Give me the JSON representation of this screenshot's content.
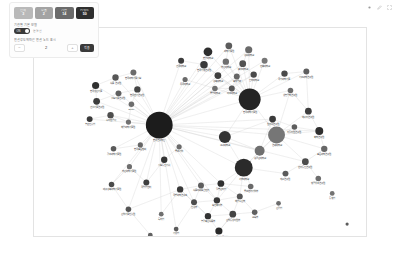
{
  "panel": {
    "stats": [
      {
        "label": "전체",
        "value": "3",
        "color": "#b9b9b9"
      },
      {
        "label": "추출",
        "value": "2",
        "color": "#a3a3a3"
      },
      {
        "label": "기관",
        "value": "14",
        "color": "#6b6b6b"
      },
      {
        "label": "키워드",
        "value": "50",
        "color": "#2f2f2f"
      }
    ],
    "filter_label": "기관별 기본 모델",
    "toggle_text": "ON",
    "toggle_side_label": "연결선",
    "depth_label": "연결강도에따른 연결 노드 표시",
    "stepper": {
      "minus": "−",
      "value": "2",
      "plus": "+"
    },
    "apply_label": "적용"
  },
  "toolbar": {
    "icons": [
      "dot-icon",
      "edit-icon",
      "expand-icon"
    ]
  },
  "graph": {
    "nodes": [
      {
        "id": "hub",
        "label": "한국연구재단",
        "x": 126,
        "y": 98,
        "r": 13.5,
        "c": "#1c1c1c",
        "fs": 2.8
      },
      {
        "id": "h2",
        "label": "한국과학기술원",
        "x": 217,
        "y": 72,
        "r": 11.0,
        "c": "#242424",
        "fs": 2.6
      },
      {
        "id": "h3",
        "label": "서울대학교",
        "x": 211,
        "y": 141,
        "r": 9.0,
        "c": "#2b2b2b",
        "fs": 2.6
      },
      {
        "id": "h4",
        "label": "연세대학교",
        "x": 244,
        "y": 108,
        "r": 8.5,
        "c": "#767676",
        "fs": 2.6
      },
      {
        "id": "h5",
        "label": "고려대학교",
        "x": 192,
        "y": 110,
        "r": 6.0,
        "c": "#333333",
        "fs": 2.4
      },
      {
        "id": "h6",
        "label": "성균관대학교",
        "x": 227,
        "y": 124,
        "r": 5.0,
        "c": "#6f6f6f",
        "fs": 2.3
      },
      {
        "id": "t1",
        "label": "한양대학교",
        "x": 175,
        "y": 24,
        "r": 4.4,
        "c": "#2e2e2e",
        "fs": 2.3
      },
      {
        "id": "t2",
        "label": "과학기술원",
        "x": 196,
        "y": 18,
        "r": 3.4,
        "c": "#5c5c5c",
        "fs": 2.2
      },
      {
        "id": "t3",
        "label": "경희대학교",
        "x": 216,
        "y": 22,
        "r": 3.6,
        "c": "#6a6a6a",
        "fs": 2.2
      },
      {
        "id": "t4",
        "label": "한국기계연구원",
        "x": 171,
        "y": 37,
        "r": 3.8,
        "c": "#3a3a3a",
        "fs": 2.2
      },
      {
        "id": "t5",
        "label": "부산대학교",
        "x": 193,
        "y": 34,
        "r": 3.2,
        "c": "#6f6f6f",
        "fs": 2.2
      },
      {
        "id": "t6",
        "label": "충남대학교",
        "x": 210,
        "y": 36,
        "r": 3.4,
        "c": "#525252",
        "fs": 2.2
      },
      {
        "id": "t7",
        "label": "전북대학교",
        "x": 232,
        "y": 33,
        "r": 3.0,
        "c": "#777777",
        "fs": 2.2
      },
      {
        "id": "t8",
        "label": "경북대학교",
        "x": 185,
        "y": 48,
        "r": 3.4,
        "c": "#3f3f3f",
        "fs": 2.2
      },
      {
        "id": "t9",
        "label": "포항공과",
        "x": 204,
        "y": 49,
        "r": 3.0,
        "c": "#666666",
        "fs": 2.2
      },
      {
        "id": "t10",
        "label": "인하대학교",
        "x": 221,
        "y": 47,
        "r": 3.2,
        "c": "#4a4a4a",
        "fs": 2.2
      },
      {
        "id": "t11",
        "label": "아주대학교",
        "x": 199,
        "y": 61,
        "r": 3.0,
        "c": "#585858",
        "fs": 2.2
      },
      {
        "id": "t12",
        "label": "중앙대학교",
        "x": 182,
        "y": 61,
        "r": 2.8,
        "c": "#707070",
        "fs": 2.2
      },
      {
        "id": "t13",
        "label": "건국대학교",
        "x": 148,
        "y": 33,
        "r": 3.0,
        "c": "#3c3c3c",
        "fs": 2.2
      },
      {
        "id": "t14",
        "label": "동국대학교",
        "x": 152,
        "y": 52,
        "r": 2.6,
        "c": "#6a6a6a",
        "fs": 2.2
      },
      {
        "id": "r1",
        "label": "국가과학기술",
        "x": 252,
        "y": 46,
        "r": 3.2,
        "c": "#4a4a4a",
        "fs": 2.2
      },
      {
        "id": "r2",
        "label": "기초과학연구원",
        "x": 274,
        "y": 44,
        "r": 3.0,
        "c": "#5e5e5e",
        "fs": 2.2
      },
      {
        "id": "r3",
        "label": "생명공학연구원",
        "x": 258,
        "y": 63,
        "r": 2.8,
        "c": "#6b6b6b",
        "fs": 2.2
      },
      {
        "id": "r4",
        "label": "에너지연구원",
        "x": 276,
        "y": 84,
        "r": 3.4,
        "c": "#3e3e3e",
        "fs": 2.2
      },
      {
        "id": "r5",
        "label": "화학연구원",
        "x": 287,
        "y": 104,
        "r": 4.0,
        "c": "#2f2f2f",
        "fs": 2.2
      },
      {
        "id": "r6",
        "label": "표준과학연구원",
        "x": 292,
        "y": 122,
        "r": 3.2,
        "c": "#676767",
        "fs": 2.2
      },
      {
        "id": "r7",
        "label": "전자통신연구원",
        "x": 273,
        "y": 135,
        "r": 3.4,
        "c": "#4c4c4c",
        "fs": 2.2
      },
      {
        "id": "r8",
        "label": "재료연구원",
        "x": 253,
        "y": 147,
        "r": 3.0,
        "c": "#5a5a5a",
        "fs": 2.2
      },
      {
        "id": "r9",
        "label": "항공우주연구원",
        "x": 286,
        "y": 152,
        "r": 2.8,
        "c": "#6e6e6e",
        "fs": 2.2
      },
      {
        "id": "r10",
        "label": "원자력연구원",
        "x": 240,
        "y": 92,
        "r": 3.4,
        "c": "#3b3b3b",
        "fs": 2.2
      },
      {
        "id": "r11",
        "label": "지질자원연구원",
        "x": 262,
        "y": 100,
        "r": 2.8,
        "c": "#5d5d5d",
        "fs": 2.2
      },
      {
        "id": "l1",
        "label": "한국생산기술",
        "x": 62,
        "y": 58,
        "r": 3.6,
        "c": "#303030",
        "fs": 2.2
      },
      {
        "id": "l2",
        "label": "식품연구원",
        "x": 82,
        "y": 50,
        "r": 3.2,
        "c": "#575757",
        "fs": 2.2
      },
      {
        "id": "l3",
        "label": "한국과학기술정보",
        "x": 100,
        "y": 45,
        "r": 3.0,
        "c": "#6b6b6b",
        "fs": 2.2
      },
      {
        "id": "l4",
        "label": "건설기술연구원",
        "x": 63,
        "y": 74,
        "r": 3.4,
        "c": "#3d3d3d",
        "fs": 2.2
      },
      {
        "id": "l5",
        "label": "철도기술연구원",
        "x": 85,
        "y": 66,
        "r": 3.0,
        "c": "#5f5f5f",
        "fs": 2.2
      },
      {
        "id": "l6",
        "label": "한국전기연구원",
        "x": 104,
        "y": 62,
        "r": 3.2,
        "c": "#454545",
        "fs": 2.2
      },
      {
        "id": "l7",
        "label": "ETRI",
        "x": 98,
        "y": 77,
        "r": 2.8,
        "c": "#6d6d6d",
        "fs": 2.3
      },
      {
        "id": "l8",
        "label": "수자원공사",
        "x": 77,
        "y": 88,
        "r": 3.2,
        "c": "#4e4e4e",
        "fs": 2.2
      },
      {
        "id": "l9",
        "label": "농촌진흥청",
        "x": 56,
        "y": 92,
        "r": 3.0,
        "c": "#3a3a3a",
        "fs": 2.2
      },
      {
        "id": "l10",
        "label": "해양과학기술원",
        "x": 95,
        "y": 95,
        "r": 2.6,
        "c": "#717171",
        "fs": 2.2
      },
      {
        "id": "m1",
        "label": "광주과학기술원",
        "x": 80,
        "y": 122,
        "r": 2.8,
        "c": "#5a5a5a",
        "fs": 2.2
      },
      {
        "id": "m2",
        "label": "울산과학기술원",
        "x": 96,
        "y": 140,
        "r": 2.6,
        "c": "#6e6e6e",
        "fs": 2.2
      },
      {
        "id": "m3",
        "label": "대구경북과학기술원",
        "x": 78,
        "y": 158,
        "r": 2.8,
        "c": "#4b4b4b",
        "fs": 2.2
      },
      {
        "id": "m4",
        "label": "한국표준협회",
        "x": 107,
        "y": 118,
        "r": 2.6,
        "c": "#666666",
        "fs": 2.2
      },
      {
        "id": "m5",
        "label": "국립암센터",
        "x": 113,
        "y": 156,
        "r": 3.0,
        "c": "#3f3f3f",
        "fs": 2.2
      },
      {
        "id": "m6",
        "label": "산업기술진흥원",
        "x": 95,
        "y": 183,
        "r": 2.8,
        "c": "#555555",
        "fs": 2.2
      },
      {
        "id": "m7",
        "label": "정보통신기획",
        "x": 131,
        "y": 133,
        "r": 3.2,
        "c": "#343434",
        "fs": 2.2
      },
      {
        "id": "m8",
        "label": "중소기업",
        "x": 146,
        "y": 120,
        "r": 2.6,
        "c": "#6b6b6b",
        "fs": 2.2
      },
      {
        "id": "b1",
        "label": "국방과학연구소",
        "x": 147,
        "y": 163,
        "r": 3.2,
        "c": "#3a3a3a",
        "fs": 2.2
      },
      {
        "id": "b2",
        "label": "식품의약품안전처",
        "x": 168,
        "y": 159,
        "r": 3.0,
        "c": "#5e5e5e",
        "fs": 2.2
      },
      {
        "id": "b3",
        "label": "질병관리청",
        "x": 188,
        "y": 157,
        "r": 3.4,
        "c": "#2f2f2f",
        "fs": 2.2
      },
      {
        "id": "b4",
        "label": "환경부",
        "x": 161,
        "y": 176,
        "r": 3.0,
        "c": "#4d4d4d",
        "fs": 2.2
      },
      {
        "id": "b5",
        "label": "보건복지부",
        "x": 184,
        "y": 174,
        "r": 3.2,
        "c": "#383838",
        "fs": 2.2
      },
      {
        "id": "b6",
        "label": "해양수산부",
        "x": 207,
        "y": 170,
        "r": 3.0,
        "c": "#565656",
        "fs": 2.2
      },
      {
        "id": "b7",
        "label": "농림축산식품부",
        "x": 175,
        "y": 190,
        "r": 3.2,
        "c": "#333333",
        "fs": 2.2
      },
      {
        "id": "b8",
        "label": "산업통상자원부",
        "x": 200,
        "y": 188,
        "r": 3.4,
        "c": "#444444",
        "fs": 2.2
      },
      {
        "id": "b9",
        "label": "과학기술정보통신부",
        "x": 186,
        "y": 205,
        "r": 3.6,
        "c": "#2a2a2a",
        "fs": 2.2
      },
      {
        "id": "b10",
        "label": "교육부",
        "x": 222,
        "y": 186,
        "r": 2.8,
        "c": "#606060",
        "fs": 2.2
      },
      {
        "id": "b11",
        "label": "중소벤처기업부",
        "x": 218,
        "y": 160,
        "r": 2.8,
        "c": "#6a6a6a",
        "fs": 2.2
      },
      {
        "id": "s1",
        "label": "특허청",
        "x": 128,
        "y": 188,
        "r": 2.4,
        "c": "#6f6f6f",
        "fs": 2.2
      },
      {
        "id": "s2",
        "label": "기상청",
        "x": 143,
        "y": 203,
        "r": 2.4,
        "c": "#5b5b5b",
        "fs": 2.2
      },
      {
        "id": "s3",
        "label": "산림청",
        "x": 246,
        "y": 177,
        "r": 2.4,
        "c": "#6c6c6c",
        "fs": 2.2
      },
      {
        "id": "s4",
        "label": "통계청",
        "x": 300,
        "y": 167,
        "r": 2.4,
        "c": "#737373",
        "fs": 2.2
      },
      {
        "id": "s5",
        "label": "문화체육관광부",
        "x": 117,
        "y": 209,
        "r": 2.4,
        "c": "#626262",
        "fs": 2.2
      },
      {
        "id": "iso",
        "label": "",
        "x": 315,
        "y": 198,
        "r": 1.6,
        "c": "#5c5c5c",
        "fs": 2.2
      }
    ],
    "edges": [
      [
        "hub",
        "h2"
      ],
      [
        "hub",
        "h3"
      ],
      [
        "hub",
        "h4"
      ],
      [
        "hub",
        "h5"
      ],
      [
        "hub",
        "h6"
      ],
      [
        "hub",
        "t1"
      ],
      [
        "hub",
        "t2"
      ],
      [
        "hub",
        "t3"
      ],
      [
        "hub",
        "t4"
      ],
      [
        "hub",
        "t5"
      ],
      [
        "hub",
        "t6"
      ],
      [
        "hub",
        "t7"
      ],
      [
        "hub",
        "t8"
      ],
      [
        "hub",
        "t9"
      ],
      [
        "hub",
        "t10"
      ],
      [
        "hub",
        "t11"
      ],
      [
        "hub",
        "t12"
      ],
      [
        "hub",
        "t13"
      ],
      [
        "hub",
        "t14"
      ],
      [
        "hub",
        "l1"
      ],
      [
        "hub",
        "l2"
      ],
      [
        "hub",
        "l3"
      ],
      [
        "hub",
        "l4"
      ],
      [
        "hub",
        "l5"
      ],
      [
        "hub",
        "l6"
      ],
      [
        "hub",
        "l7"
      ],
      [
        "hub",
        "l8"
      ],
      [
        "hub",
        "l9"
      ],
      [
        "hub",
        "l10"
      ],
      [
        "hub",
        "m1"
      ],
      [
        "hub",
        "m2"
      ],
      [
        "hub",
        "m3"
      ],
      [
        "hub",
        "m4"
      ],
      [
        "hub",
        "m5"
      ],
      [
        "hub",
        "m6"
      ],
      [
        "hub",
        "m7"
      ],
      [
        "hub",
        "m8"
      ],
      [
        "hub",
        "b1"
      ],
      [
        "hub",
        "b2"
      ],
      [
        "hub",
        "b3"
      ],
      [
        "hub",
        "b4"
      ],
      [
        "hub",
        "b5"
      ],
      [
        "hub",
        "r10"
      ],
      [
        "hub",
        "r5"
      ],
      [
        "hub",
        "r7"
      ],
      [
        "hub",
        "s1"
      ],
      [
        "hub",
        "s2"
      ],
      [
        "h2",
        "t1"
      ],
      [
        "h2",
        "t2"
      ],
      [
        "h2",
        "t3"
      ],
      [
        "h2",
        "t4"
      ],
      [
        "h2",
        "t5"
      ],
      [
        "h2",
        "t6"
      ],
      [
        "h2",
        "t7"
      ],
      [
        "h2",
        "t8"
      ],
      [
        "h2",
        "t9"
      ],
      [
        "h2",
        "t10"
      ],
      [
        "h2",
        "t11"
      ],
      [
        "h2",
        "t12"
      ],
      [
        "h2",
        "r1"
      ],
      [
        "h2",
        "r2"
      ],
      [
        "h2",
        "r3"
      ],
      [
        "h2",
        "h4"
      ],
      [
        "h2",
        "h5"
      ],
      [
        "t1",
        "t4"
      ],
      [
        "t2",
        "t5"
      ],
      [
        "t3",
        "t6"
      ],
      [
        "t4",
        "t8"
      ],
      [
        "t5",
        "t9"
      ],
      [
        "t6",
        "t10"
      ],
      [
        "t8",
        "t11"
      ],
      [
        "t9",
        "t11"
      ],
      [
        "t10",
        "t11"
      ],
      [
        "t12",
        "t11"
      ],
      [
        "t13",
        "t4"
      ],
      [
        "t14",
        "t12"
      ],
      [
        "h4",
        "r4"
      ],
      [
        "h4",
        "r5"
      ],
      [
        "h4",
        "r6"
      ],
      [
        "h4",
        "r7"
      ],
      [
        "h4",
        "r11"
      ],
      [
        "h4",
        "h6"
      ],
      [
        "h4",
        "r10"
      ],
      [
        "h4",
        "h3"
      ],
      [
        "h4",
        "r3"
      ],
      [
        "r4",
        "r5"
      ],
      [
        "r5",
        "r6"
      ],
      [
        "r6",
        "r7"
      ],
      [
        "r7",
        "r8"
      ],
      [
        "r7",
        "r9"
      ],
      [
        "r5",
        "r11"
      ],
      [
        "r1",
        "r2"
      ],
      [
        "r2",
        "r4"
      ],
      [
        "r3",
        "r4"
      ],
      [
        "r10",
        "r11"
      ],
      [
        "r8",
        "h3"
      ],
      [
        "h3",
        "h5"
      ],
      [
        "h3",
        "h6"
      ],
      [
        "h3",
        "b3"
      ],
      [
        "h3",
        "b5"
      ],
      [
        "h3",
        "b6"
      ],
      [
        "h3",
        "b11"
      ],
      [
        "h5",
        "h6"
      ],
      [
        "h5",
        "r10"
      ],
      [
        "h6",
        "r10"
      ],
      [
        "l1",
        "l2"
      ],
      [
        "l2",
        "l3"
      ],
      [
        "l4",
        "l5"
      ],
      [
        "l5",
        "l6"
      ],
      [
        "l6",
        "l7"
      ],
      [
        "l1",
        "l4"
      ],
      [
        "l3",
        "l6"
      ],
      [
        "l8",
        "l10"
      ],
      [
        "l9",
        "l8"
      ],
      [
        "l7",
        "l10"
      ],
      [
        "m1",
        "m4"
      ],
      [
        "m2",
        "m5"
      ],
      [
        "m3",
        "m6"
      ],
      [
        "m7",
        "m8"
      ],
      [
        "m5",
        "m7"
      ],
      [
        "b1",
        "b2"
      ],
      [
        "b2",
        "b3"
      ],
      [
        "b1",
        "b4"
      ],
      [
        "b2",
        "b5"
      ],
      [
        "b3",
        "b6"
      ],
      [
        "b4",
        "b5"
      ],
      [
        "b5",
        "b6"
      ],
      [
        "b4",
        "b7"
      ],
      [
        "b5",
        "b7"
      ],
      [
        "b5",
        "b8"
      ],
      [
        "b6",
        "b8"
      ],
      [
        "b7",
        "b9"
      ],
      [
        "b8",
        "b9"
      ],
      [
        "b8",
        "b10"
      ],
      [
        "b6",
        "b10"
      ],
      [
        "b3",
        "b11"
      ],
      [
        "b7",
        "b8"
      ],
      [
        "b2",
        "b4"
      ],
      [
        "b3",
        "b5"
      ],
      [
        "b9",
        "b8"
      ],
      [
        "b1",
        "b7"
      ],
      [
        "s3",
        "b10"
      ],
      [
        "s2",
        "b4"
      ],
      [
        "s1",
        "b1"
      ],
      [
        "s5",
        "m6"
      ],
      [
        "m6",
        "b1"
      ],
      [
        "m3",
        "m2"
      ]
    ]
  }
}
